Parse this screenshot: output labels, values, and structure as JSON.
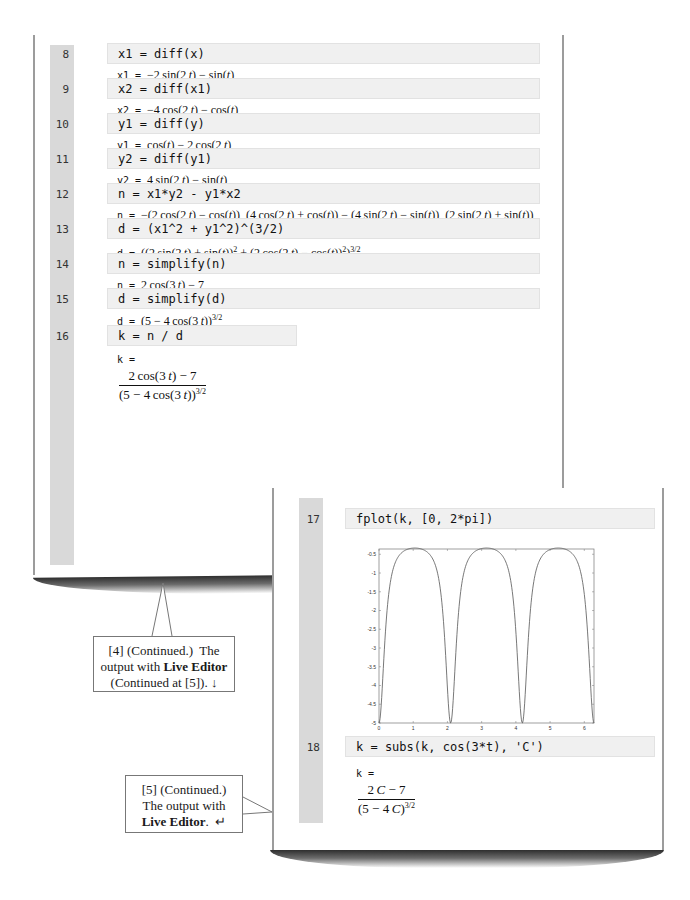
{
  "left_panel": {
    "cells": [
      {
        "line": "8",
        "code": "x1 = diff(x)",
        "out_var": "x1 =",
        "out_html": "&minus;2&thinsp;sin(2&thinsp;<i>t</i>) &minus; sin(<i>t</i>)"
      },
      {
        "line": "9",
        "code": "x2 = diff(x1)",
        "out_var": "x2 =",
        "out_html": "&minus;4&thinsp;cos(2&thinsp;<i>t</i>) &minus; cos(<i>t</i>)"
      },
      {
        "line": "10",
        "code": "y1 = diff(y)",
        "out_var": "y1 =",
        "out_html": "cos(<i>t</i>) &minus; 2&thinsp;cos(2&thinsp;<i>t</i>)"
      },
      {
        "line": "11",
        "code": "y2 = diff(y1)",
        "out_var": "y2 =",
        "out_html": "4&thinsp;sin(2&thinsp;<i>t</i>) &minus; sin(<i>t</i>)"
      },
      {
        "line": "12",
        "code": "n = x1*y2 - y1*x2",
        "out_var": "n =",
        "out_html": "&minus;(2&thinsp;cos(2&thinsp;<i>t</i>) &minus; cos(<i>t</i>))&nbsp; (4&thinsp;cos(2&thinsp;<i>t</i>) + cos(<i>t</i>)) &minus; (4&thinsp;sin(2&thinsp;<i>t</i>) &minus; sin(<i>t</i>))&nbsp; (2&thinsp;sin(2&thinsp;<i>t</i>) + sin(<i>t</i>))"
      },
      {
        "line": "13",
        "code": "d = (x1^2 + y1^2)^(3/2)",
        "out_var": "d =",
        "out_html": "((2&thinsp;sin(2&thinsp;<i>t</i>) + sin(<i>t</i>))<sup>2</sup> + (2&thinsp;cos(2&thinsp;<i>t</i>) &minus; cos(<i>t</i>))<sup>2</sup>)<sup>3/2</sup>"
      },
      {
        "line": "14",
        "code": "n = simplify(n)",
        "out_var": "n =",
        "out_html": "2&thinsp;cos(3&thinsp;<i>t</i>) &minus; 7"
      },
      {
        "line": "15",
        "code": "d = simplify(d)",
        "out_var": "d =",
        "out_html": "(5 &minus; 4&thinsp;cos(3&thinsp;<i>t</i>))<sup>3/2</sup>"
      },
      {
        "line": "16",
        "code": "k = n / d",
        "out_var": "k =",
        "frac_num": "2&thinsp;cos(3&thinsp;<i>t</i>) &minus; 7",
        "frac_den": "(5 &minus; 4&thinsp;cos(3&thinsp;<i>t</i>))<sup>3/2</sup>"
      }
    ]
  },
  "right_panel": {
    "cells": [
      {
        "line": "17",
        "code": "fplot(k, [0, 2*pi])"
      },
      {
        "line": "18",
        "code": "k = subs(k, cos(3*t), 'C')",
        "out_var": "k =",
        "frac_num": "2&thinsp;<i>C</i> &minus; 7",
        "frac_den": "(5 &minus; 4&thinsp;<i>C</i>)<sup>3/2</sup>"
      }
    ]
  },
  "callouts": {
    "c4_html": "[4] (Continued.)&nbsp; The output with <b>Live Editor</b> (Continued at [5]). &darr;",
    "c5_html": "[5] (Continued.) The output with <b>Live Editor</b>. &nbsp;&crarr;"
  },
  "chart_data": {
    "type": "line",
    "title": "",
    "xlabel": "",
    "ylabel": "",
    "function": "k(t) = (2*cos(3*t) - 7) / (5 - 4*cos(3*t))^(3/2)",
    "xlim": [
      0,
      6.2832
    ],
    "ylim": [
      -5,
      -0.3593
    ],
    "xticks": [
      "0",
      "1",
      "2",
      "3",
      "4",
      "5",
      "6"
    ],
    "xtick_values": [
      0,
      1,
      2,
      3,
      4,
      5,
      6
    ],
    "yticks": [
      "-0.5",
      "-1",
      "-1.5",
      "-2",
      "-2.5",
      "-3",
      "-3.5",
      "-4",
      "-4.5",
      "-5"
    ],
    "ytick_values": [
      -0.5,
      -1,
      -1.5,
      -2,
      -2.5,
      -3,
      -3.5,
      -4,
      -4.5,
      -5
    ],
    "series": [
      {
        "name": "k",
        "samples": 400,
        "color": "#555555"
      }
    ],
    "grid": false,
    "legend": "none"
  },
  "colors": {
    "gutter": "#d9d9d9",
    "code_bg": "#f0f0f0",
    "panel_border": "#9c9c9c"
  }
}
